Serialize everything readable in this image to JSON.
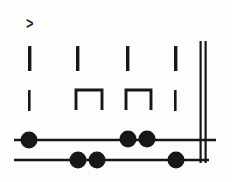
{
  "figure": {
    "background_color": "#fdfdfd",
    "ink_color": "#17171a",
    "width": 232,
    "height": 182
  },
  "annotations": {
    "caret": {
      "symbol": ">",
      "x": 26,
      "y": 15
    }
  },
  "rows": [
    {
      "name": "tick-row-upper",
      "label": "upper stroke row",
      "y_top": 46,
      "y_bottom": 71,
      "marks": [
        {
          "kind": "vertical-bar",
          "x": 28,
          "width": 3.4,
          "height": 25
        },
        {
          "kind": "vertical-bar",
          "x": 76,
          "width": 3.4,
          "height": 25
        },
        {
          "kind": "vertical-bar",
          "x": 126,
          "width": 3.4,
          "height": 25
        },
        {
          "kind": "vertical-bar",
          "x": 174,
          "width": 3.4,
          "height": 25
        }
      ]
    },
    {
      "name": "tick-row-lower",
      "label": "lower stroke row",
      "y_top": 90,
      "y_bottom": 111,
      "marks": [
        {
          "kind": "vertical-bar",
          "x": 28,
          "width": 2.6,
          "height": 21
        },
        {
          "kind": "bracket-down",
          "x_left": 76,
          "x_right": 102,
          "height": 20
        },
        {
          "kind": "bracket-down",
          "x_left": 126,
          "x_right": 151,
          "height": 20
        },
        {
          "kind": "vertical-bar",
          "x": 174,
          "width": 2.6,
          "height": 21
        }
      ]
    }
  ],
  "staff_lines": [
    {
      "name": "beat-line-upper",
      "y": 140,
      "x_start": 14,
      "x_end": 216,
      "thickness": 2.4,
      "nodes": [
        {
          "label": "node-1",
          "cx": 29,
          "cy": 140,
          "r": 8.5
        },
        {
          "label": "node-2",
          "cx": 128,
          "cy": 139,
          "r": 8.5
        },
        {
          "label": "node-3",
          "cx": 147,
          "cy": 139,
          "r": 8.5
        }
      ]
    },
    {
      "name": "beat-line-lower",
      "y": 160,
      "x_start": 14,
      "x_end": 209,
      "thickness": 2.4,
      "nodes": [
        {
          "label": "node-4",
          "cx": 78,
          "cy": 160,
          "r": 8.5
        },
        {
          "label": "node-5",
          "cx": 97,
          "cy": 160,
          "r": 8.5
        },
        {
          "label": "node-6",
          "cx": 176,
          "cy": 160,
          "r": 8.5
        }
      ]
    }
  ],
  "barline": {
    "name": "double-barline",
    "strokes": [
      {
        "x": 199.5,
        "y_top": 41,
        "y_bottom": 163,
        "width": 2.2
      },
      {
        "x": 204.5,
        "y_top": 41,
        "y_bottom": 163,
        "width": 2.2
      }
    ]
  }
}
